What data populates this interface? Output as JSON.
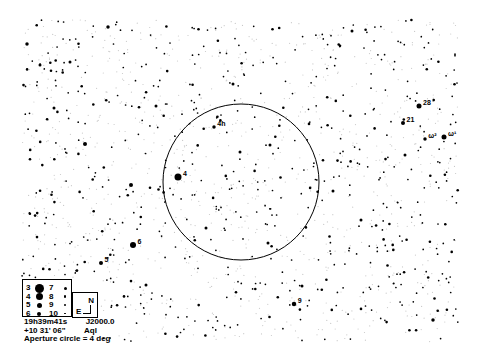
{
  "chart": {
    "center_ra": "19h39m41s",
    "epoch": "J2000.0",
    "center_dec": "+10 31' 06\"",
    "constellation": "Aql",
    "aperture_text": "Aperture circle = 4 deg",
    "aperture_circle": {
      "cx": 241,
      "cy": 182,
      "r": 78
    },
    "field": {
      "x0": 22,
      "y0": 20,
      "x1": 458,
      "y1": 342
    },
    "colors": {
      "background": "#ffffff",
      "star": "#000000",
      "faint": "#c8c8c8"
    }
  },
  "legend": {
    "magnitudes": [
      {
        "mag": "3",
        "size": 9
      },
      {
        "mag": "4",
        "size": 7
      },
      {
        "mag": "5",
        "size": 5
      },
      {
        "mag": "6",
        "size": 4
      },
      {
        "mag": "7",
        "size": 3
      },
      {
        "mag": "8",
        "size": 2.5
      },
      {
        "mag": "9",
        "size": 2
      },
      {
        "mag": "10",
        "size": 1.6
      }
    ],
    "orientation": {
      "north": "N",
      "east": "E"
    }
  },
  "labeled_stars": [
    {
      "label": "28",
      "x": 419,
      "y": 106,
      "size": 5
    },
    {
      "label": "21",
      "x": 403,
      "y": 123,
      "size": 4
    },
    {
      "label": "ω²",
      "x": 425,
      "y": 139,
      "size": 3.5
    },
    {
      "label": "ω¹",
      "x": 444,
      "y": 137,
      "size": 5
    },
    {
      "label": "4h",
      "x": 214,
      "y": 127,
      "size": 3.5
    },
    {
      "label": "4",
      "x": 178,
      "y": 177,
      "size": 7
    },
    {
      "label": "6",
      "x": 133,
      "y": 245,
      "size": 6
    },
    {
      "label": "5",
      "x": 101,
      "y": 263,
      "size": 4
    },
    {
      "label": "9",
      "x": 294,
      "y": 304,
      "size": 4.5
    }
  ],
  "bright_stars": [
    {
      "x": 85,
      "y": 144,
      "size": 4
    },
    {
      "x": 131,
      "y": 185,
      "size": 4
    },
    {
      "x": 70,
      "y": 62,
      "size": 3
    },
    {
      "x": 27,
      "y": 44,
      "size": 3.5
    },
    {
      "x": 108,
      "y": 27,
      "size": 3.5
    },
    {
      "x": 40,
      "y": 65,
      "size": 3
    },
    {
      "x": 156,
      "y": 106,
      "size": 3
    },
    {
      "x": 233,
      "y": 84,
      "size": 3
    },
    {
      "x": 352,
      "y": 31,
      "size": 3
    },
    {
      "x": 333,
      "y": 191,
      "size": 3
    },
    {
      "x": 405,
      "y": 155,
      "size": 3
    },
    {
      "x": 433,
      "y": 320,
      "size": 3.5
    },
    {
      "x": 54,
      "y": 108,
      "size": 3
    },
    {
      "x": 361,
      "y": 220,
      "size": 3
    },
    {
      "x": 240,
      "y": 152,
      "size": 3
    },
    {
      "x": 270,
      "y": 145,
      "size": 3
    },
    {
      "x": 146,
      "y": 285,
      "size": 3
    },
    {
      "x": 206,
      "y": 228,
      "size": 3
    },
    {
      "x": 268,
      "y": 243,
      "size": 3
    },
    {
      "x": 302,
      "y": 286,
      "size": 3
    }
  ],
  "field_generation": {
    "seed": 20240,
    "dark_count": 640,
    "faint_count": 900
  }
}
